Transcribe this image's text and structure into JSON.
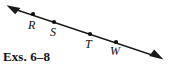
{
  "figure": {
    "type": "geometry-line-diagram",
    "caption": "Exs. 6–8",
    "background_color": "#ffffff",
    "stroke_color": "#1a1a1a",
    "line": {
      "start": [
        7,
        6
      ],
      "end": [
        162,
        58
      ],
      "arrow_start": true,
      "arrow_end": true,
      "description": "line with arrowheads at both ends"
    },
    "points": [
      {
        "label": "R",
        "dot": [
          33,
          14
        ],
        "label_pos": [
          28,
          19
        ]
      },
      {
        "label": "S",
        "dot": [
          54,
          22
        ],
        "label_pos": [
          50,
          26
        ]
      },
      {
        "label": "T",
        "dot": [
          90,
          34
        ],
        "label_pos": [
          85,
          38
        ]
      },
      {
        "label": "W",
        "dot": [
          116,
          42
        ],
        "label_pos": [
          110,
          45
        ]
      }
    ],
    "point_labels": [
      "R",
      "S",
      "T",
      "W"
    ]
  }
}
